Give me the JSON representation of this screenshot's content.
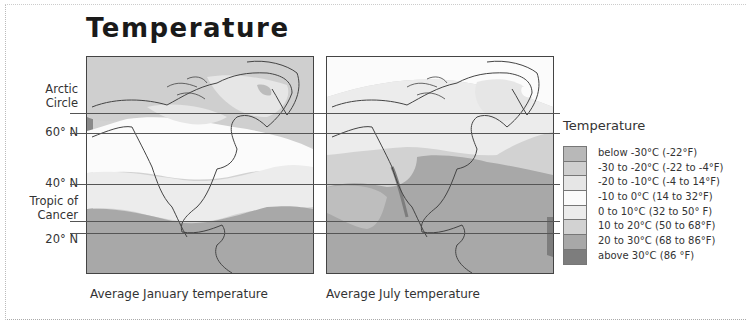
{
  "title": "Temperature",
  "latitude_labels": [
    {
      "text": "Arctic\nCircle",
      "line1": "Arctic",
      "line2": "Circle",
      "y": 113
    },
    {
      "text": "60° N",
      "y": 133
    },
    {
      "text": "40° N",
      "y": 184
    },
    {
      "text": "Tropic of\nCancer",
      "line1": "Tropic of",
      "line2": "Cancer",
      "y": 221
    },
    {
      "text": "20° N",
      "y": 233
    }
  ],
  "maps": [
    {
      "caption": "Average January temperature"
    },
    {
      "caption": "Average July temperature"
    }
  ],
  "legend": {
    "title": "Temperature",
    "items": [
      {
        "label": "below -30°C (-22°F)",
        "color": "#b8b8b8"
      },
      {
        "label": "-30 to -20°C (-22 to -4°F)",
        "color": "#cfcfcf"
      },
      {
        "label": "-20 to -10°C (-4 to 14°F)",
        "color": "#e6e6e6"
      },
      {
        "label": "-10 to 0°C (14 to 32°F)",
        "color": "#fbfbfb"
      },
      {
        "label": "0 to 10°C (32 to 50° F)",
        "color": "#ececec"
      },
      {
        "label": "10 to 20°C (50 to 68°F)",
        "color": "#d2d2d2"
      },
      {
        "label": "20 to 30°C (68 to 86°F)",
        "color": "#a8a8a8"
      },
      {
        "label": "above 30°C (86 °F)",
        "color": "#7d7d7d"
      }
    ]
  }
}
